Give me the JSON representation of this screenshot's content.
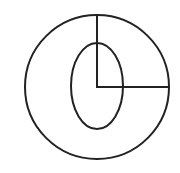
{
  "diagram": {
    "background": "#ffffff",
    "stroke_color": "#222222",
    "stroke_width": 2,
    "center": {
      "x": 97,
      "y": 87
    },
    "outer_circle": {
      "cx": 97,
      "cy": 87,
      "r": 72
    },
    "inner_ellipse": {
      "cx": 97,
      "cy": 86,
      "rx": 26,
      "ry": 43
    },
    "radius_vertical": {
      "x1": 97,
      "y1": 87,
      "x2": 97,
      "y2": 15
    },
    "radius_horizontal": {
      "x1": 97,
      "y1": 87,
      "x2": 169,
      "y2": 87
    }
  }
}
